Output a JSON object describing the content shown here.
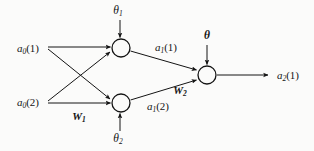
{
  "figure": {
    "type": "neural-network-diagram",
    "background_color": "#fbfbfa",
    "stroke_color": "#141414"
  },
  "inputs": [
    {
      "id": "a0-1",
      "base": "a",
      "sub": "0",
      "arg": "(1)",
      "x": 28,
      "y": 48
    },
    {
      "id": "a0-2",
      "base": "a",
      "sub": "0",
      "arg": "(2)",
      "x": 28,
      "y": 102
    }
  ],
  "hidden_activations": [
    {
      "id": "a1-1",
      "base": "a",
      "sub": "1",
      "arg": "(1)",
      "x": 166,
      "y": 47
    },
    {
      "id": "a1-2",
      "base": "a",
      "sub": "1",
      "arg": "(2)",
      "x": 158,
      "y": 106
    }
  ],
  "output_activation": {
    "id": "a2-1",
    "base": "a",
    "sub": "2",
    "arg": "(1)",
    "x": 288,
    "y": 75
  },
  "weights": [
    {
      "id": "W1",
      "base": "W",
      "sub": "1",
      "x": 79,
      "y": 116
    },
    {
      "id": "W2",
      "base": "W",
      "sub": "2",
      "x": 180,
      "y": 90
    }
  ],
  "biases": [
    {
      "id": "theta1",
      "base": "θ",
      "sub": "1",
      "x": 118,
      "y": 11
    },
    {
      "id": "theta2",
      "base": "θ",
      "sub": "2",
      "x": 118,
      "y": 139
    },
    {
      "id": "theta-out",
      "base": "θ",
      "sub": "",
      "x": 207,
      "y": 36
    }
  ],
  "neurons": [
    {
      "id": "hidden-neuron-1",
      "cx": 121,
      "cy": 48,
      "r": 9
    },
    {
      "id": "hidden-neuron-2",
      "cx": 121,
      "cy": 103,
      "r": 9
    },
    {
      "id": "output-neuron",
      "cx": 207,
      "cy": 75,
      "r": 9
    }
  ]
}
